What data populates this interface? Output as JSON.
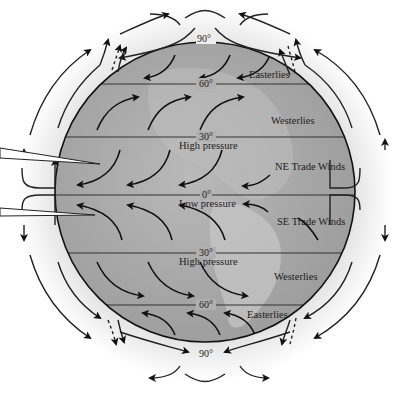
{
  "diagram": {
    "latitudes": [
      {
        "label": "90°",
        "position": "north-pole"
      },
      {
        "label": "60°",
        "position": "north"
      },
      {
        "label": "30°",
        "position": "north"
      },
      {
        "label": "0°",
        "position": "equator"
      },
      {
        "label": "30°",
        "position": "south"
      },
      {
        "label": "60°",
        "position": "south"
      },
      {
        "label": "90°",
        "position": "south-pole"
      }
    ],
    "pressure_labels": {
      "north_30": "High pressure",
      "equator": "Low pressure",
      "south_30": "High pressure"
    },
    "wind_belts": {
      "north_polar": "Easterlies",
      "north_mid": "Westerlies",
      "north_trade": "NE Trade Winds",
      "south_trade": "SE Trade Winds",
      "south_mid": "Westerlies",
      "south_polar": "Easterlies"
    },
    "colors": {
      "globe_fill": "#a9a9a9",
      "globe_light": "#c4c4c4",
      "atmosphere": "#f2f2f2",
      "lines": "#111111"
    }
  }
}
